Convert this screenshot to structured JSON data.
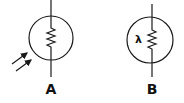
{
  "diagram": {
    "symbols": [
      {
        "id": "A",
        "label": "A",
        "type": "photoresistor",
        "description": "resistor in circle with incident light arrows"
      },
      {
        "id": "B",
        "label": "B",
        "type": "light-dependent-resistor",
        "description": "resistor in circle with lambda symbol",
        "inner_text": "λ"
      }
    ],
    "colors": {
      "stroke": "#1a1a1a",
      "background": "#ffffff"
    }
  }
}
